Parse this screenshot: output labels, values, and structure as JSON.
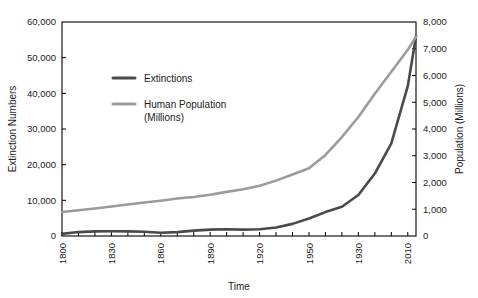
{
  "chart_data": {
    "type": "line",
    "title": "",
    "xlabel": "Time",
    "ylabel": "Extinction Numbers",
    "y2label": "Population (Millions)",
    "grid": false,
    "legend_position": "upper-left-inside",
    "xlim": [
      1800,
      2015
    ],
    "ylim": [
      0,
      60000
    ],
    "y2lim": [
      0,
      8000
    ],
    "xticks_labeled": [
      "1800",
      "1830",
      "1860",
      "1890",
      "1920",
      "1950",
      "1930",
      "2010"
    ],
    "xtick_values": [
      1800,
      1830,
      1860,
      1890,
      1920,
      1950,
      1980,
      2010
    ],
    "xtick_minor_step": 10,
    "yticks": [
      "0",
      "10,000",
      "20,000",
      "30,000",
      "40,000",
      "50,000",
      "60,000"
    ],
    "ytick_values": [
      0,
      10000,
      20000,
      30000,
      40000,
      50000,
      60000
    ],
    "y2ticks": [
      "0",
      "1,000",
      "2,000",
      "3,000",
      "4,000",
      "5,000",
      "6,000",
      "7,000",
      "8,000"
    ],
    "y2tick_values": [
      0,
      1000,
      2000,
      3000,
      4000,
      5000,
      6000,
      7000,
      8000
    ],
    "series": [
      {
        "name": "Extinctions",
        "axis": "left",
        "color": "#4a4a4a",
        "width": 2.6,
        "x": [
          1800,
          1810,
          1820,
          1830,
          1840,
          1850,
          1860,
          1870,
          1880,
          1890,
          1900,
          1910,
          1920,
          1930,
          1940,
          1950,
          1960,
          1970,
          1980,
          1990,
          2000,
          2010,
          2015
        ],
        "values": [
          600,
          1100,
          1300,
          1350,
          1300,
          1200,
          900,
          1100,
          1500,
          1800,
          1900,
          1800,
          1900,
          2400,
          3400,
          4900,
          6700,
          8200,
          11500,
          17500,
          26000,
          42000,
          56000
        ]
      },
      {
        "name": "Human Population (Millions)",
        "axis": "right",
        "color": "#9b9b9b",
        "width": 2.6,
        "x": [
          1800,
          1810,
          1820,
          1830,
          1840,
          1850,
          1860,
          1870,
          1880,
          1890,
          1900,
          1910,
          1920,
          1930,
          1940,
          1950,
          1960,
          1970,
          1980,
          1990,
          2000,
          2010,
          2015
        ],
        "values": [
          900,
          960,
          1030,
          1100,
          1180,
          1250,
          1320,
          1400,
          1460,
          1540,
          1650,
          1750,
          1880,
          2070,
          2300,
          2530,
          3030,
          3700,
          4450,
          5320,
          6140,
          6960,
          7450
        ]
      }
    ]
  },
  "legend": {
    "entries": [
      {
        "label": "Extinctions",
        "label2": "",
        "color": "#4a4a4a"
      },
      {
        "label": "Human Population",
        "label2": "(Millions)",
        "color": "#9b9b9b"
      }
    ]
  }
}
